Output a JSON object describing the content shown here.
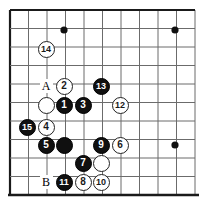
{
  "diagram": {
    "type": "go-board-diagram",
    "title": "",
    "board": {
      "grid_origin_x": 10,
      "grid_origin_y": 10,
      "grid_spacing": 18.5,
      "cols": 11,
      "rows": 11,
      "line_color": "#6b6b6b",
      "edge_color": "#1a1a1a",
      "background": "#ffffff",
      "stone_diameter": 17,
      "star_point_radius": 3.6,
      "star_points": [
        {
          "name": "star-point-top-left",
          "x": 64,
          "y": 30
        },
        {
          "name": "star-point-top-right",
          "x": 175,
          "y": 30
        },
        {
          "name": "star-point-bottom-right",
          "x": 175,
          "y": 145
        }
      ]
    },
    "stones": [
      {
        "id": "stone-14",
        "color": "white",
        "label": "14",
        "x": 46,
        "y": 49
      },
      {
        "id": "stone-2",
        "color": "white",
        "label": "2",
        "x": 64,
        "y": 86
      },
      {
        "id": "stone-13",
        "color": "black",
        "label": "13",
        "x": 101,
        "y": 86
      },
      {
        "id": "stone-white-unnumbered-upper",
        "color": "white",
        "label": "",
        "x": 46,
        "y": 105
      },
      {
        "id": "stone-1",
        "color": "black",
        "label": "1",
        "x": 64,
        "y": 105
      },
      {
        "id": "stone-3",
        "color": "black",
        "label": "3",
        "x": 83,
        "y": 105
      },
      {
        "id": "stone-12",
        "color": "white",
        "label": "12",
        "x": 120,
        "y": 105
      },
      {
        "id": "stone-15",
        "color": "black",
        "label": "15",
        "x": 27,
        "y": 127
      },
      {
        "id": "stone-4",
        "color": "white",
        "label": "4",
        "x": 46,
        "y": 127
      },
      {
        "id": "stone-5",
        "color": "black",
        "label": "5",
        "x": 46,
        "y": 145
      },
      {
        "id": "stone-black-unnumbered-center",
        "color": "black",
        "label": "",
        "x": 64,
        "y": 145
      },
      {
        "id": "stone-9",
        "color": "black",
        "label": "9",
        "x": 101,
        "y": 145
      },
      {
        "id": "stone-6",
        "color": "white",
        "label": "6",
        "x": 120,
        "y": 145
      },
      {
        "id": "stone-7",
        "color": "black",
        "label": "7",
        "x": 83,
        "y": 163
      },
      {
        "id": "stone-white-unnumbered-lower",
        "color": "white",
        "label": "",
        "x": 101,
        "y": 163
      },
      {
        "id": "stone-11",
        "color": "black",
        "label": "11",
        "x": 64,
        "y": 182
      },
      {
        "id": "stone-8",
        "color": "white",
        "label": "8",
        "x": 83,
        "y": 182
      },
      {
        "id": "stone-10",
        "color": "white",
        "label": "10",
        "x": 101,
        "y": 182
      }
    ],
    "point_markers": [
      {
        "id": "marker-a",
        "label": "A",
        "x": 46,
        "y": 86
      },
      {
        "id": "marker-b",
        "label": "B",
        "x": 46,
        "y": 182
      }
    ]
  }
}
